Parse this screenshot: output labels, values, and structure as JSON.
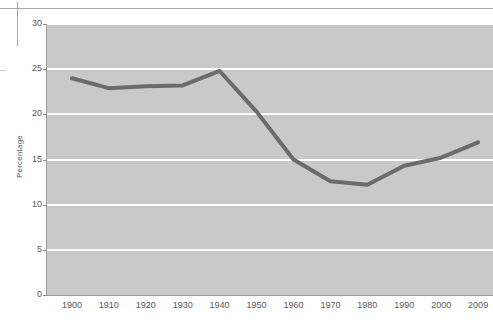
{
  "figure": {
    "background_color": "#ffffff",
    "plot_background_color": "#c9c9c9",
    "gridline_color": "#ffffff",
    "axis_color": "#9a9a9a",
    "tick_text_color": "#58585a"
  },
  "decorations": {
    "top_rule_name": "top-horizontal-rule",
    "left_tick_name": "left-vertical-rule"
  },
  "chart_data": {
    "type": "line",
    "title": "",
    "xlabel": "",
    "ylabel": "Percentage",
    "categories": [
      "1900",
      "1910",
      "1920",
      "1930",
      "1940",
      "1950",
      "1960",
      "1970",
      "1980",
      "1990",
      "2000",
      "2009"
    ],
    "x": [
      1900,
      1910,
      1920,
      1930,
      1940,
      1950,
      1960,
      1970,
      1980,
      1990,
      2000,
      2009
    ],
    "values": [
      24.0,
      22.9,
      23.1,
      23.2,
      24.8,
      20.3,
      15.0,
      12.6,
      12.2,
      14.3,
      15.2,
      16.9
    ],
    "series": [
      {
        "name": "Percentage",
        "color": "#6b6b6b",
        "line_width": 4,
        "values": [
          24.0,
          22.9,
          23.1,
          23.2,
          24.8,
          20.3,
          15.0,
          12.6,
          12.2,
          14.3,
          15.2,
          16.9
        ]
      }
    ],
    "ylim": [
      0,
      30
    ],
    "yticks": [
      0,
      5,
      10,
      15,
      20,
      25,
      30
    ],
    "ytick_labels": [
      "0",
      "5",
      "10",
      "15",
      "20",
      "25",
      "30"
    ],
    "xtick_labels": [
      "1900",
      "1910",
      "1920",
      "1930",
      "1940",
      "1950",
      "1960",
      "1970",
      "1980",
      "1990",
      "2000",
      "2009"
    ],
    "grid": true,
    "grid_axis": "y",
    "legend": false,
    "legend_position": "none",
    "annotations": []
  }
}
